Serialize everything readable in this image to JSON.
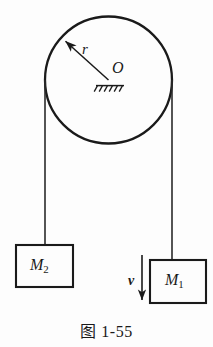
{
  "figure": {
    "caption": "图 1-55",
    "background_color": "#fdfdfd",
    "ink_color": "#1a1a1a",
    "pulley": {
      "name": "pulley-circle",
      "center_label": "O",
      "radius_label": "r",
      "center_x": 108.5,
      "center_y": 80,
      "radius": 63.5,
      "axle_support": "hatched-ground-symbol"
    },
    "radius_arrow": {
      "from_x": 108.5,
      "from_y": 80,
      "to_x": 63,
      "to_y": 39
    },
    "left_rope": {
      "name": "left-rope",
      "x": 45,
      "top_y": 80,
      "bottom_y": 245
    },
    "right_rope": {
      "name": "right-rope",
      "x": 172,
      "top_y": 80,
      "bottom_y": 260
    },
    "block_left": {
      "label": "M",
      "subscript": "2",
      "x": 16,
      "y": 245,
      "width": 57,
      "height": 42
    },
    "block_right": {
      "label": "M",
      "subscript": "1",
      "x": 150,
      "y": 260,
      "width": 56,
      "height": 43
    },
    "velocity_arrow": {
      "label": "v",
      "x": 142,
      "top_y": 255,
      "bottom_y": 303,
      "direction": "down"
    }
  }
}
